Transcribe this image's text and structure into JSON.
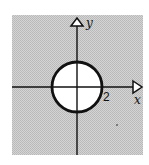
{
  "figure": {
    "x_axis_label": "x",
    "y_axis_label": "y",
    "radius_label": "2",
    "colors": {
      "background": "#ffffff",
      "shaded_region": "#c9c9c9",
      "stroke": "#111111",
      "circle_fill": "#ffffff"
    }
  }
}
